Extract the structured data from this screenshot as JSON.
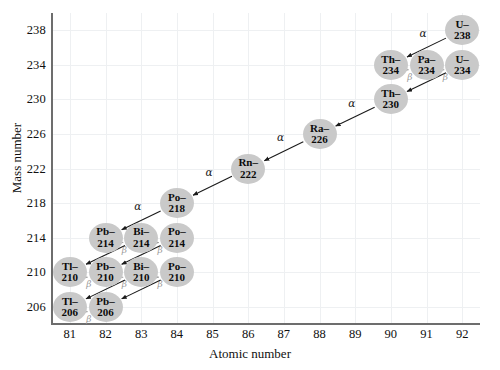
{
  "chart_data": {
    "type": "scatter",
    "title": "",
    "xlabel": "Atomic number",
    "ylabel": "Mass number",
    "xlim": [
      80.5,
      92.5
    ],
    "ylim": [
      204,
      240
    ],
    "xticks": [
      81,
      82,
      83,
      84,
      85,
      86,
      87,
      88,
      89,
      90,
      91,
      92
    ],
    "yticks": [
      206,
      210,
      214,
      218,
      222,
      226,
      230,
      234,
      238
    ],
    "grid": true,
    "legend": "none",
    "node_color": "#c9c9c9",
    "alpha_color": "#1a1a1a",
    "beta_color": "#9a9a9a",
    "nodes": [
      {
        "id": "U-238",
        "element": "U",
        "mass": "238",
        "z": 92,
        "a": 238,
        "label_top": "U–",
        "label_bottom": "238"
      },
      {
        "id": "Th-234",
        "element": "Th",
        "mass": "234",
        "z": 90,
        "a": 234,
        "label_top": "Th–",
        "label_bottom": "234"
      },
      {
        "id": "Pa-234",
        "element": "Pa",
        "mass": "234",
        "z": 91,
        "a": 234,
        "label_top": "Pa–",
        "label_bottom": "234"
      },
      {
        "id": "U-234",
        "element": "U",
        "mass": "234",
        "z": 92,
        "a": 234,
        "label_top": "U–",
        "label_bottom": "234"
      },
      {
        "id": "Th-230",
        "element": "Th",
        "mass": "230",
        "z": 90,
        "a": 230,
        "label_top": "Th–",
        "label_bottom": "230"
      },
      {
        "id": "Ra-226",
        "element": "Ra",
        "mass": "226",
        "z": 88,
        "a": 226,
        "label_top": "Ra–",
        "label_bottom": "226"
      },
      {
        "id": "Rn-222",
        "element": "Rn",
        "mass": "222",
        "z": 86,
        "a": 222,
        "label_top": "Rn–",
        "label_bottom": "222"
      },
      {
        "id": "Po-218",
        "element": "Po",
        "mass": "218",
        "z": 84,
        "a": 218,
        "label_top": "Po–",
        "label_bottom": "218"
      },
      {
        "id": "Pb-214",
        "element": "Pb",
        "mass": "214",
        "z": 82,
        "a": 214,
        "label_top": "Pb–",
        "label_bottom": "214"
      },
      {
        "id": "Bi-214",
        "element": "Bi",
        "mass": "214",
        "z": 83,
        "a": 214,
        "label_top": "Bi–",
        "label_bottom": "214"
      },
      {
        "id": "Po-214",
        "element": "Po",
        "mass": "214",
        "z": 84,
        "a": 214,
        "label_top": "Po–",
        "label_bottom": "214"
      },
      {
        "id": "Tl-210",
        "element": "Tl",
        "mass": "210",
        "z": 81,
        "a": 210,
        "label_top": "Tl–",
        "label_bottom": "210"
      },
      {
        "id": "Pb-210",
        "element": "Pb",
        "mass": "210",
        "z": 82,
        "a": 210,
        "label_top": "Pb–",
        "label_bottom": "210"
      },
      {
        "id": "Bi-210",
        "element": "Bi",
        "mass": "210",
        "z": 83,
        "a": 210,
        "label_top": "Bi–",
        "label_bottom": "210"
      },
      {
        "id": "Po-210",
        "element": "Po",
        "mass": "210",
        "z": 84,
        "a": 210,
        "label_top": "Po–",
        "label_bottom": "210"
      },
      {
        "id": "Tl-206",
        "element": "Tl",
        "mass": "206",
        "z": 81,
        "a": 206,
        "label_top": "Tl–",
        "label_bottom": "206"
      },
      {
        "id": "Pb-206",
        "element": "Pb",
        "mass": "206",
        "z": 82,
        "a": 206,
        "label_top": "Pb–",
        "label_bottom": "206"
      }
    ],
    "decays": [
      {
        "from": "U-238",
        "to": "Th-234",
        "type": "alpha",
        "label": "α"
      },
      {
        "from": "Th-234",
        "to": "Pa-234",
        "type": "beta",
        "label": "β"
      },
      {
        "from": "Pa-234",
        "to": "U-234",
        "type": "beta",
        "label": "β"
      },
      {
        "from": "U-234",
        "to": "Th-230",
        "type": "alpha",
        "label": "α"
      },
      {
        "from": "Th-230",
        "to": "Ra-226",
        "type": "alpha",
        "label": "α"
      },
      {
        "from": "Ra-226",
        "to": "Rn-222",
        "type": "alpha",
        "label": "α"
      },
      {
        "from": "Rn-222",
        "to": "Po-218",
        "type": "alpha",
        "label": "α"
      },
      {
        "from": "Po-218",
        "to": "Pb-214",
        "type": "alpha",
        "label": "α"
      },
      {
        "from": "Pb-214",
        "to": "Bi-214",
        "type": "beta",
        "label": "β"
      },
      {
        "from": "Bi-214",
        "to": "Po-214",
        "type": "beta",
        "label": "β"
      },
      {
        "from": "Bi-214",
        "to": "Tl-210",
        "type": "alpha",
        "label": "α"
      },
      {
        "from": "Po-214",
        "to": "Pb-210",
        "type": "alpha",
        "label": "α"
      },
      {
        "from": "Tl-210",
        "to": "Pb-210",
        "type": "beta",
        "label": "β"
      },
      {
        "from": "Pb-210",
        "to": "Bi-210",
        "type": "beta",
        "label": "β"
      },
      {
        "from": "Bi-210",
        "to": "Po-210",
        "type": "beta",
        "label": "β"
      },
      {
        "from": "Bi-210",
        "to": "Tl-206",
        "type": "alpha",
        "label": "α"
      },
      {
        "from": "Po-210",
        "to": "Pb-206",
        "type": "alpha",
        "label": "α"
      },
      {
        "from": "Tl-206",
        "to": "Pb-206",
        "type": "beta",
        "label": "β"
      }
    ]
  }
}
